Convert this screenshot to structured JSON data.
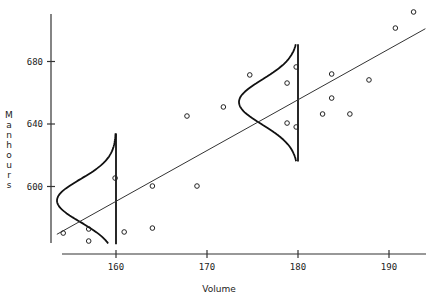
{
  "chart_data": {
    "type": "scatter",
    "title": "",
    "xlabel": "Volume",
    "ylabel": "Manhours",
    "xlim": [
      153.5,
      194
    ],
    "ylim": [
      563,
      718
    ],
    "x_ticks": [
      160,
      170,
      180,
      190
    ],
    "x_tick_labels": [
      "160",
      "170",
      "180",
      "190"
    ],
    "y_ticks": [
      600,
      640,
      680
    ],
    "y_tick_labels": [
      "600",
      "640",
      "680"
    ],
    "grid": false,
    "legend": null,
    "points": [
      {
        "x": 154.2,
        "y": 570.2
      },
      {
        "x": 157.0,
        "y": 572.8
      },
      {
        "x": 157.0,
        "y": 565.1
      },
      {
        "x": 159.9,
        "y": 605.4
      },
      {
        "x": 160.9,
        "y": 570.9
      },
      {
        "x": 164.0,
        "y": 573.4
      },
      {
        "x": 164.0,
        "y": 600.3
      },
      {
        "x": 167.8,
        "y": 645.1
      },
      {
        "x": 168.9,
        "y": 600.3
      },
      {
        "x": 171.8,
        "y": 650.9
      },
      {
        "x": 174.7,
        "y": 671.4
      },
      {
        "x": 178.8,
        "y": 666.2
      },
      {
        "x": 178.8,
        "y": 640.6
      },
      {
        "x": 179.8,
        "y": 676.5
      },
      {
        "x": 179.8,
        "y": 638.1
      },
      {
        "x": 182.7,
        "y": 646.4
      },
      {
        "x": 183.7,
        "y": 672.0
      },
      {
        "x": 183.7,
        "y": 656.6
      },
      {
        "x": 185.7,
        "y": 646.4
      },
      {
        "x": 187.8,
        "y": 668.2
      },
      {
        "x": 190.7,
        "y": 701.4
      },
      {
        "x": 192.7,
        "y": 711.7
      }
    ],
    "regression_line": {
      "x_start": 153.5,
      "y_start": 569.4,
      "x_end": 194.0,
      "y_end": 701.0
    },
    "normal_curves": [
      {
        "at_x": 160,
        "mean": 591.0,
        "y_range": [
          563,
          634
        ],
        "direction": "left"
      },
      {
        "at_x": 180,
        "mean": 654.0,
        "y_range": [
          616,
          691
        ],
        "direction": "left"
      }
    ],
    "annotations": []
  }
}
